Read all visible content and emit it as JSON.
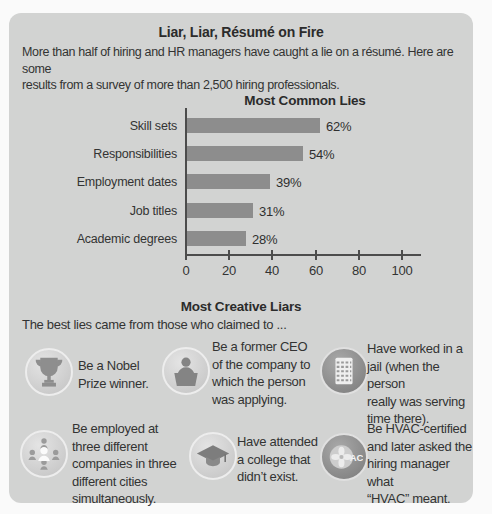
{
  "header": {
    "title": "Liar, Liar, Résumé on Fire",
    "intro": "More than half of hiring and HR managers have caught a lie on a résumé. Here are some\nresults from a survey of more than 2,500 hiring professionals."
  },
  "chart_data": {
    "type": "bar",
    "orientation": "horizontal",
    "title": "Most Common Lies",
    "categories": [
      "Skill sets",
      "Responsibilities",
      "Employment dates",
      "Job titles",
      "Academic degrees"
    ],
    "values": [
      62,
      54,
      39,
      31,
      28
    ],
    "value_labels": [
      "62%",
      "54%",
      "39%",
      "31%",
      "28%"
    ],
    "unit": "%",
    "xlim": [
      0,
      100
    ],
    "x_ticks": [
      "0",
      "20",
      "40",
      "60",
      "80",
      "100"
    ],
    "grid": false,
    "bar_color": "#8d8d8d"
  },
  "creative_liars": {
    "title": "Most Creative Liars",
    "intro": "The best lies came from those who claimed to ...",
    "items": [
      {
        "icon": "trophy-icon",
        "text": "Be a Nobel\nPrize winner."
      },
      {
        "icon": "ceo-podium-icon",
        "text": "Be a former CEO\nof the company to\nwhich the person\nwas applying."
      },
      {
        "icon": "jail-window-icon",
        "text": "Have worked in a\njail (when the person\nreally was serving\ntime there)."
      },
      {
        "icon": "multiple-people-icon",
        "text": "Be employed at\nthree different\ncompanies in three\ndifferent cities\nsimultaneously."
      },
      {
        "icon": "graduation-cap-icon",
        "text": "Have attended\na college that\ndidn’t exist."
      },
      {
        "icon": "hvac-fan-icon",
        "text": "Be HVAC-certified\nand later asked the\nhiring manager what\n“HVAC” meant."
      }
    ]
  },
  "colors": {
    "card_background": "#d2d3d2",
    "bar": "#8d8d8d",
    "axis": "#4c4c4c",
    "text": "#333333"
  }
}
